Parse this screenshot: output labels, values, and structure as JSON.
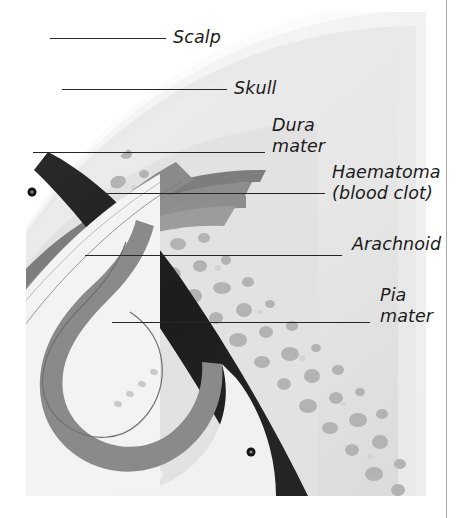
{
  "figure": {
    "kind": "anatomical-cross-section",
    "frame": {
      "right_rule_color": "#a9a9a9"
    }
  },
  "palette": {
    "page_background": "#ffffff",
    "scalp_outer": "#f2f2f2",
    "scalp_inner": "#e4e4e4",
    "skull_outer_table": "#ededed",
    "skull_diploe": "#e8e8e8",
    "skull_cavity": "#b0b0b0",
    "dura_mater": "#8e8e8e",
    "haematoma": "#1f1f1f",
    "arachnoid_space": "#9a9a9a",
    "arachnoid_trabecula": "#efefef",
    "pia_mater": "#8a8a8a",
    "brain_cortex": "#f4f4f4",
    "brain_white_matter": "#eaeaea",
    "sulcus_line": "#6f6f6f",
    "vessel_dot": "#161616",
    "leader_line": "#262626",
    "label_text": "#1b1b1b"
  },
  "labels": [
    {
      "id": "scalp",
      "text": "Scalp",
      "lines": [
        "Scalp"
      ],
      "text_x": 173,
      "text_y": 27,
      "leader": {
        "x1": 50,
        "y1": 38,
        "x2": 166,
        "y2": 38
      }
    },
    {
      "id": "skull",
      "text": "Skull",
      "lines": [
        "Skull"
      ],
      "text_x": 234,
      "text_y": 78,
      "leader": {
        "x1": 62,
        "y1": 89,
        "x2": 227,
        "y2": 89
      }
    },
    {
      "id": "dura-mater",
      "text": "Dura mater",
      "lines": [
        "Dura",
        "mater"
      ],
      "text_x": 272,
      "text_y": 115,
      "leader": {
        "x1": 33,
        "y1": 152,
        "x2": 265,
        "y2": 152
      }
    },
    {
      "id": "haematoma",
      "text": "Haematoma (blood clot)",
      "lines": [
        "Haematoma",
        "(blood clot)"
      ],
      "text_x": 332,
      "text_y": 162,
      "leader": {
        "x1": 103,
        "y1": 193,
        "x2": 325,
        "y2": 193
      }
    },
    {
      "id": "arachnoid",
      "text": "Arachnoid",
      "lines": [
        "Arachnoid"
      ],
      "text_x": 352,
      "text_y": 234,
      "leader": {
        "x1": 85,
        "y1": 255,
        "x2": 342,
        "y2": 255
      }
    },
    {
      "id": "pia-mater",
      "text": "Pia mater",
      "lines": [
        "Pia",
        "mater"
      ],
      "text_x": 380,
      "text_y": 285,
      "leader": {
        "x1": 112,
        "y1": 322,
        "x2": 370,
        "y2": 322
      }
    }
  ],
  "layers": [
    {
      "id": "scalp",
      "name": "Scalp",
      "order": 1
    },
    {
      "id": "skull",
      "name": "Skull",
      "order": 2
    },
    {
      "id": "dura-mater",
      "name": "Dura mater",
      "order": 3
    },
    {
      "id": "haematoma",
      "name": "Haematoma (blood clot)",
      "order": 4
    },
    {
      "id": "arachnoid",
      "name": "Arachnoid",
      "order": 5
    },
    {
      "id": "pia-mater",
      "name": "Pia mater",
      "order": 6
    },
    {
      "id": "brain",
      "name": "Brain",
      "order": 7
    }
  ]
}
